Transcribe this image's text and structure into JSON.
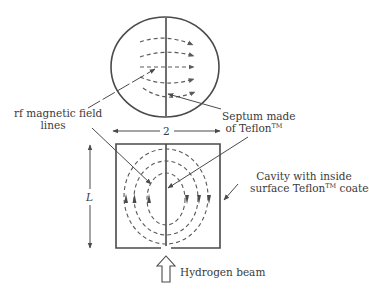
{
  "colors": {
    "stroke": "#4a4a4a",
    "dash": "#5a5a5a",
    "text": "#3a3a3a",
    "background": "#ffffff"
  },
  "labels": {
    "rf_field": {
      "line1": "rf magnetic field",
      "line2": "lines"
    },
    "septum": {
      "line1": "Septum made",
      "line2_prefix": "of Teflon",
      "line2_tm": "TM"
    },
    "cavity": {
      "line1": "Cavity with inside",
      "line2_prefix": "surface Teflon",
      "line2_tm": "TM",
      "line2_suffix": " coated"
    },
    "width_dimension": "2",
    "length_dimension": "L",
    "beam": "Hydrogen beam"
  },
  "figure": {
    "top_view": {
      "shape": "circle",
      "cx": 165,
      "cy": 67,
      "rx": 54,
      "ry": 50,
      "field_line_count": 5,
      "field_direction": "left-to-right"
    },
    "side_view": {
      "shape": "rectangle",
      "x": 116,
      "y": 144,
      "width": 104,
      "height": 104,
      "field_loop_count": 3,
      "left_arrows": "up",
      "right_arrows": "down"
    },
    "beam_arrow": {
      "style": "hollow",
      "direction": "up"
    }
  }
}
